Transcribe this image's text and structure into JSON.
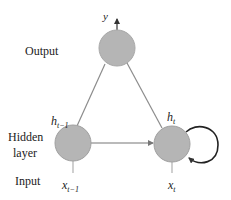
{
  "diagram": {
    "colors": {
      "background": "#ffffff",
      "node_fill": "#b5b5b5",
      "node_stroke": "#a0a0a0",
      "edge": "#8c8c8c",
      "arrow": "#333333",
      "text": "#222222"
    },
    "layer_labels": {
      "output": "Output",
      "hidden_line1": "Hidden",
      "hidden_line2": "layer",
      "input": "Input"
    },
    "nodes": [
      {
        "id": "output",
        "label": "y",
        "cx": 117,
        "cy": 48,
        "r": 18
      },
      {
        "id": "hidden_prev",
        "label_base": "h",
        "label_sub": "t−1",
        "cx": 73,
        "cy": 143,
        "r": 18
      },
      {
        "id": "hidden_curr",
        "label_base": "h",
        "label_sub": "t",
        "cx": 172,
        "cy": 144,
        "r": 18
      }
    ],
    "inputs": [
      {
        "id": "x_prev",
        "label_base": "x",
        "label_sub": "t−1"
      },
      {
        "id": "x_curr",
        "label_base": "x",
        "label_sub": "t"
      }
    ],
    "edges": [
      {
        "from": "hidden_prev",
        "to": "output",
        "type": "line"
      },
      {
        "from": "hidden_curr",
        "to": "output",
        "type": "line"
      },
      {
        "from": "hidden_prev",
        "to": "hidden_curr",
        "type": "arrow"
      },
      {
        "from": "hidden_curr",
        "to": "hidden_curr",
        "type": "self-loop"
      },
      {
        "from": "x_prev",
        "to": "hidden_prev",
        "type": "line"
      },
      {
        "from": "x_curr",
        "to": "hidden_curr",
        "type": "line"
      },
      {
        "from": "output",
        "to": "y",
        "type": "arrow"
      }
    ]
  }
}
